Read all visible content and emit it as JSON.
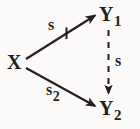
{
  "figure": {
    "kind": "path-diagram",
    "background_color": "#fbfaf8",
    "ink_color": "#231f1e",
    "width": 140,
    "height": 129
  },
  "nodes": [
    {
      "id": "X",
      "base": "X",
      "subscript": "",
      "x": 14,
      "y": 62
    },
    {
      "id": "Y1",
      "base": "Y",
      "subscript": "1",
      "x": 112,
      "y": 14
    },
    {
      "id": "Y2",
      "base": "Y",
      "subscript": "2",
      "x": 112,
      "y": 110
    }
  ],
  "edges": [
    {
      "id": "x-to-y1",
      "from": "X",
      "to": "Y1",
      "style": "solid",
      "arrowhead": "filled",
      "label_base": "s",
      "label_subscript": "1"
    },
    {
      "id": "x-to-y2",
      "from": "X",
      "to": "Y2",
      "style": "solid",
      "arrowhead": "filled",
      "label_base": "s",
      "label_subscript": "2"
    },
    {
      "id": "y1-to-y2",
      "from": "Y1",
      "to": "Y2",
      "style": "dashed",
      "arrowhead": "filled",
      "label_base": "s",
      "label_subscript": ""
    }
  ]
}
